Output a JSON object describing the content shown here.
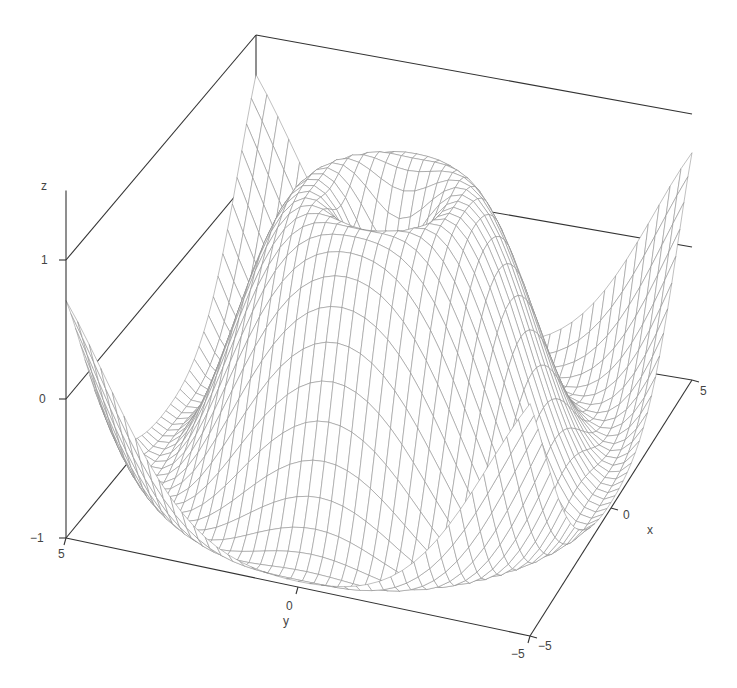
{
  "chart_data": {
    "type": "surface-wireframe",
    "title": "",
    "function": "z = sin(sqrt(x^2 + y^2))",
    "x": {
      "label": "x",
      "range": [
        -5,
        5
      ],
      "ticks": [
        -5,
        0,
        5
      ],
      "tick_labels": [
        "-5",
        "0",
        "5"
      ]
    },
    "y": {
      "label": "y",
      "range": [
        -5,
        5
      ],
      "ticks": [
        -5,
        0,
        5
      ],
      "tick_labels": [
        "-5",
        "0",
        "5"
      ]
    },
    "z": {
      "label": "z",
      "range": [
        -1,
        1
      ],
      "ticks": [
        -1,
        0,
        1
      ],
      "tick_labels": [
        "-1",
        "0",
        "1"
      ]
    },
    "grid_points": 41,
    "mesh_color": "#8c8c8c",
    "axis_color": "#333333",
    "background": "#ffffff",
    "legend": null,
    "grid": "box walls at z ticks",
    "sample_values": [
      {
        "x": 0,
        "y": 0,
        "z": 0.0
      },
      {
        "x": 1.57,
        "y": 0,
        "z": 1.0
      },
      {
        "x": 4.71,
        "y": 0,
        "z": -1.0
      },
      {
        "x": 5,
        "y": 5,
        "z": 0.7
      },
      {
        "x": -5,
        "y": -5,
        "z": 0.7
      },
      {
        "x": 5,
        "y": -5,
        "z": 0.7
      },
      {
        "x": -5,
        "y": 5,
        "z": 0.7
      }
    ]
  },
  "labels": {
    "z_axis": "z",
    "z_tick_1": "1",
    "z_tick_0": "0",
    "z_tick_m1": "−1",
    "y_axis": "y",
    "y_tick_5": "5",
    "y_tick_0": "0",
    "y_tick_m5": "−5",
    "x_axis": "x",
    "x_tick_m5": "−5",
    "x_tick_0": "0",
    "x_tick_5": "5"
  }
}
